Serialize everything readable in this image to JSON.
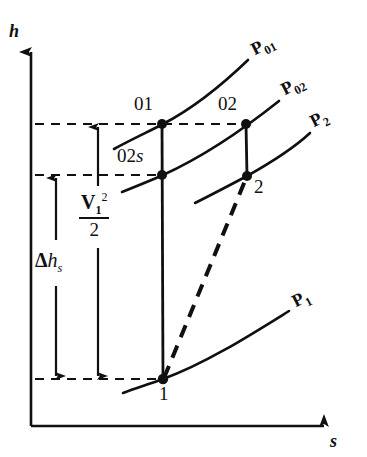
{
  "figure": {
    "type": "thermodynamic-h-s-diagram",
    "background_color": "#ffffff",
    "ink_color": "#101010",
    "width": 367,
    "height": 457
  },
  "axes": {
    "y_label": "h",
    "x_label": "s",
    "origin": {
      "x": 31,
      "y": 426
    },
    "y_top": 45,
    "x_right": 330
  },
  "state_points": [
    {
      "id": "01",
      "label": "01",
      "x": 162,
      "y": 124,
      "label_x": 134,
      "label_y": 96
    },
    {
      "id": "02",
      "label": "02",
      "x": 246,
      "y": 124,
      "label_x": 218,
      "label_y": 96
    },
    {
      "id": "02s",
      "label": "02",
      "label_italic": "s",
      "x": 162,
      "y": 175,
      "label_x": 118,
      "label_y": 147
    },
    {
      "id": "2",
      "label": "2",
      "x": 247,
      "y": 175,
      "label_x": 254,
      "label_y": 178
    },
    {
      "id": "1",
      "label": "1",
      "x": 163,
      "y": 379,
      "label_x": 159,
      "label_y": 384
    }
  ],
  "pressure_curves": [
    {
      "id": "p01",
      "label": "P",
      "sub": "01",
      "label_x": 253,
      "label_y": 48,
      "rotation": -27
    },
    {
      "id": "p02",
      "label": "P",
      "sub": "02",
      "label_x": 283,
      "label_y": 88,
      "rotation": -27
    },
    {
      "id": "p2",
      "label": "P",
      "sub": "2",
      "label_x": 312,
      "label_y": 120,
      "rotation": -27
    },
    {
      "id": "p1",
      "label": "P",
      "sub": "1",
      "label_x": 295,
      "label_y": 300,
      "rotation": -27
    }
  ],
  "measurements": [
    {
      "id": "v1-squared-over-2",
      "kind": "fraction",
      "numerator_main": "V",
      "numerator_sub": "1",
      "numerator_sup": "2",
      "denominator": "2",
      "label_x": 80,
      "label_y": 206,
      "arrow_x": 98,
      "arrow_top": 124,
      "arrow_bottom": 379
    },
    {
      "id": "delta-h-s",
      "kind": "symbol",
      "delta": "Δ",
      "main": "h",
      "sub": "s",
      "label_x": 36,
      "label_y": 262,
      "arrow_x": 56,
      "arrow_top": 175,
      "arrow_bottom": 379
    }
  ],
  "enthalpy_levels": [
    {
      "id": "level-stagnation-inlet",
      "y": 124,
      "x_start": 35,
      "x_end": 246
    },
    {
      "id": "level-02s",
      "y": 175,
      "x_start": 35,
      "x_end": 165
    },
    {
      "id": "level-static-inlet",
      "y": 379,
      "x_start": 35,
      "x_end": 165
    }
  ],
  "process_lines": [
    {
      "id": "isentropic-vertical",
      "style": "solid",
      "from": "1",
      "to": "01"
    },
    {
      "id": "actual-process",
      "style": "dashed",
      "from": "1",
      "to": "2"
    },
    {
      "id": "stagnation-tie-02",
      "style": "solid",
      "from": "2",
      "to": "02"
    }
  ]
}
